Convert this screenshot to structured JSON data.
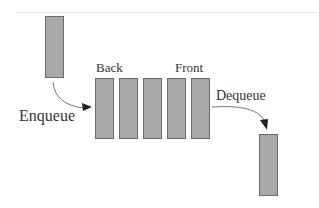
{
  "diagram": {
    "title": "Queue",
    "labels": {
      "back": "Back",
      "front": "Front",
      "enqueue": "Enqueue",
      "dequeue": "Dequeue"
    },
    "queue_element_count": 5,
    "colors": {
      "box_fill": "#a9a9a9",
      "box_border": "#6a6a6a",
      "arrow": "#555555"
    }
  }
}
